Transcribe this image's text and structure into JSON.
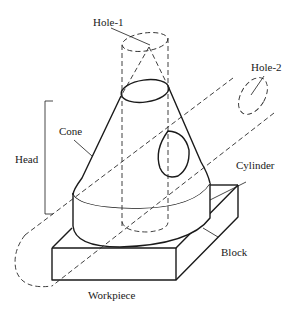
{
  "diagram": {
    "type": "isometric-part-sketch",
    "line_color": "#1a1a1a",
    "background": "#ffffff",
    "labels": {
      "hole1": "Hole-1",
      "hole2": "Hole-2",
      "cone": "Cone",
      "head": "Head",
      "cylinder": "Cylinder",
      "block": "Block",
      "workpiece": "Workpiece"
    },
    "components": [
      {
        "name": "Hole-1",
        "style": "dashed",
        "shape": "vertical cylinder"
      },
      {
        "name": "Hole-2",
        "style": "dashed",
        "shape": "inclined cylinder"
      },
      {
        "name": "Cone",
        "style": "solid",
        "part_of": "Head"
      },
      {
        "name": "Cylinder",
        "style": "solid",
        "part_of": "Head"
      },
      {
        "name": "Block",
        "style": "solid",
        "shape": "rectangular slab"
      }
    ]
  }
}
